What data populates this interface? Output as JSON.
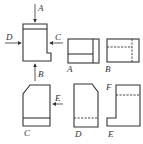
{
  "figure": {
    "colors": {
      "line": "#333333",
      "background": "#ffffff"
    },
    "directions": [
      {
        "label": "A",
        "position": "top"
      },
      {
        "label": "B",
        "position": "bottom"
      },
      {
        "label": "C",
        "position": "right"
      },
      {
        "label": "D",
        "position": "left"
      },
      {
        "label": "E",
        "position": "right-lower"
      }
    ],
    "views": [
      {
        "label": "A"
      },
      {
        "label": "B"
      },
      {
        "label": "C"
      },
      {
        "label": "D"
      },
      {
        "label": "E"
      },
      {
        "label": "F"
      }
    ]
  }
}
